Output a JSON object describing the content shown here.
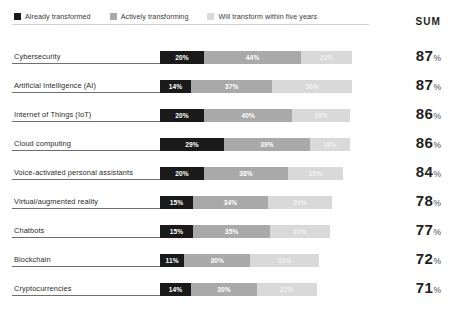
{
  "legend": {
    "items": [
      {
        "label": "Already transformed",
        "color": "#1a1a1a",
        "icon": "square-swatch-icon"
      },
      {
        "label": "Actively transforming",
        "color": "#a9a9a9",
        "icon": "square-swatch-icon"
      },
      {
        "label": "Will transform within five years",
        "color": "#d9d9d9",
        "icon": "square-swatch-icon"
      }
    ]
  },
  "sum_header": "SUM",
  "chart_data": {
    "type": "bar",
    "title": "",
    "subtype": "stacked-horizontal",
    "xlabel": "",
    "ylabel": "",
    "xlim": [
      0,
      100
    ],
    "grid": false,
    "legend_position": "top-left",
    "categories": [
      "Cybersecurity",
      "Artificial Intelligence (AI)",
      "Internet of Things (IoT)",
      "Cloud computing",
      "Voice-activated personal assistants",
      "Virtual/augmented reality",
      "Chatbots",
      "Blockchain",
      "Cryptocurrencies"
    ],
    "series": [
      {
        "name": "Already transformed",
        "color": "#1a1a1a",
        "values": [
          20,
          14,
          20,
          29,
          20,
          15,
          15,
          11,
          14
        ]
      },
      {
        "name": "Actively transforming",
        "color": "#a9a9a9",
        "values": [
          44,
          37,
          40,
          39,
          38,
          34,
          35,
          30,
          30
        ]
      },
      {
        "name": "Will transform within five years",
        "color": "#d9d9d9",
        "values": [
          23,
          36,
          26,
          18,
          25,
          29,
          27,
          31,
          27
        ]
      }
    ],
    "sums": [
      87,
      87,
      86,
      86,
      84,
      78,
      77,
      72,
      71
    ],
    "value_suffix": "%"
  },
  "rows": [
    {
      "label": "Cybersecurity",
      "segments": [
        {
          "value": "20%",
          "pct": 20
        },
        {
          "value": "44%",
          "pct": 44
        },
        {
          "value": "23%",
          "pct": 23
        }
      ],
      "sum": "87",
      "sum_pct": "%"
    },
    {
      "label": "Artificial Intelligence (AI)",
      "segments": [
        {
          "value": "14%",
          "pct": 14
        },
        {
          "value": "37%",
          "pct": 37
        },
        {
          "value": "36%",
          "pct": 36
        }
      ],
      "sum": "87",
      "sum_pct": "%"
    },
    {
      "label": "Internet of Things (IoT)",
      "segments": [
        {
          "value": "20%",
          "pct": 20
        },
        {
          "value": "40%",
          "pct": 40
        },
        {
          "value": "26%",
          "pct": 26
        }
      ],
      "sum": "86",
      "sum_pct": "%"
    },
    {
      "label": "Cloud computing",
      "segments": [
        {
          "value": "29%",
          "pct": 29
        },
        {
          "value": "39%",
          "pct": 39
        },
        {
          "value": "18%",
          "pct": 18
        }
      ],
      "sum": "86",
      "sum_pct": "%"
    },
    {
      "label": "Voice-activated personal assistants",
      "segments": [
        {
          "value": "20%",
          "pct": 20
        },
        {
          "value": "38%",
          "pct": 38
        },
        {
          "value": "25%",
          "pct": 25
        }
      ],
      "sum": "84",
      "sum_pct": "%"
    },
    {
      "label": "Virtual/augmented reality",
      "segments": [
        {
          "value": "15%",
          "pct": 15
        },
        {
          "value": "34%",
          "pct": 34
        },
        {
          "value": "29%",
          "pct": 29
        }
      ],
      "sum": "78",
      "sum_pct": "%"
    },
    {
      "label": "Chatbots",
      "segments": [
        {
          "value": "15%",
          "pct": 15
        },
        {
          "value": "35%",
          "pct": 35
        },
        {
          "value": "27%",
          "pct": 27
        }
      ],
      "sum": "77",
      "sum_pct": "%"
    },
    {
      "label": "Blockchain",
      "segments": [
        {
          "value": "11%",
          "pct": 11
        },
        {
          "value": "30%",
          "pct": 30
        },
        {
          "value": "31%",
          "pct": 31
        }
      ],
      "sum": "72",
      "sum_pct": "%"
    },
    {
      "label": "Cryptocurrencies",
      "segments": [
        {
          "value": "14%",
          "pct": 14
        },
        {
          "value": "30%",
          "pct": 30
        },
        {
          "value": "27%",
          "pct": 27
        }
      ],
      "sum": "71",
      "sum_pct": "%"
    }
  ]
}
